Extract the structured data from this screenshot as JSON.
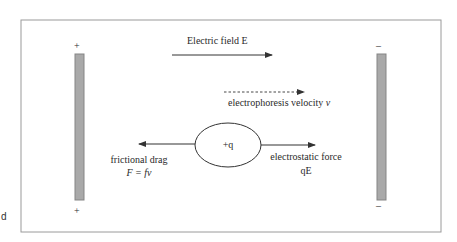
{
  "diagram": {
    "title_label": "Electric field  E",
    "velocity_label_prefix": "electrophoresis velocity ",
    "velocity_symbol": "v",
    "particle_label": "+q",
    "drag_label": "frictional drag",
    "drag_formula": "F  =  fv",
    "force_label": "electrostatic force",
    "force_formula": "qE",
    "left_plate": {
      "top_sign": "+",
      "bottom_sign": "+"
    },
    "right_plate": {
      "top_sign": "–",
      "bottom_sign": "–"
    },
    "edge_fragment": "d"
  },
  "colors": {
    "plate_fill": "#a9a9a9",
    "plate_stroke": "#858585",
    "frame_stroke": "#9a9a9a",
    "line": "#333333"
  }
}
